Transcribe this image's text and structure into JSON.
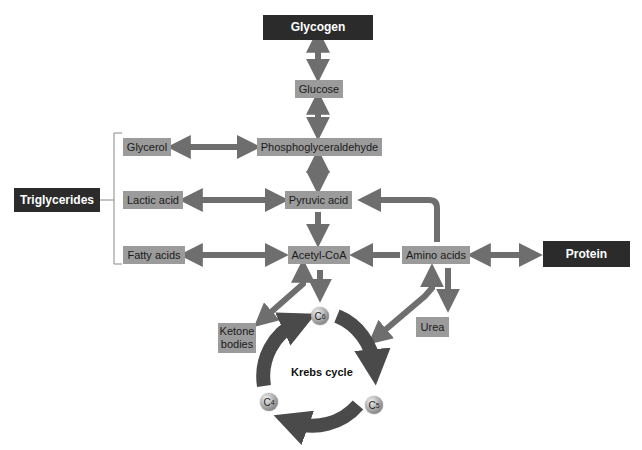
{
  "diagram": {
    "colors": {
      "box": "#9b9b9b",
      "dark_box": "#2b2b2b",
      "arrow": "#6e6e6e",
      "cycle_arrow": "#4a4a4a"
    },
    "nodes": {
      "glycogen": "Glycogen",
      "glucose": "Glucose",
      "phosphoglyceraldehyde": "Phosphoglyceraldehyde",
      "glycerol": "Glycerol",
      "triglycerides": "Triglycerides",
      "lactic_acid": "Lactic acid",
      "pyruvic_acid": "Pyruvic acid",
      "fatty_acids": "Fatty acids",
      "acetyl_coa": "Acetyl-CoA",
      "amino_acids": "Amino acids",
      "protein": "Protein",
      "urea": "Urea",
      "ketone_bodies": "Ketone bodies",
      "krebs_cycle": "Krebs cycle"
    },
    "cycle_intermediates": {
      "c6": {
        "letter": "C",
        "sub": "6"
      },
      "c5": {
        "letter": "C",
        "sub": "5"
      },
      "c4": {
        "letter": "C",
        "sub": "4"
      }
    },
    "edges": [
      {
        "from": "Glycogen",
        "to": "Glucose",
        "type": "bidirectional"
      },
      {
        "from": "Glucose",
        "to": "Phosphoglyceraldehyde",
        "type": "bidirectional"
      },
      {
        "from": "Glycerol",
        "to": "Phosphoglyceraldehyde",
        "type": "bidirectional"
      },
      {
        "from": "Phosphoglyceraldehyde",
        "to": "Pyruvic acid",
        "type": "bidirectional"
      },
      {
        "from": "Lactic acid",
        "to": "Pyruvic acid",
        "type": "bidirectional"
      },
      {
        "from": "Pyruvic acid",
        "to": "Acetyl-CoA",
        "type": "forward"
      },
      {
        "from": "Fatty acids",
        "to": "Acetyl-CoA",
        "type": "bidirectional"
      },
      {
        "from": "Amino acids",
        "to": "Acetyl-CoA",
        "type": "forward"
      },
      {
        "from": "Amino acids",
        "to": "Pyruvic acid",
        "type": "forward"
      },
      {
        "from": "Amino acids",
        "to": "Protein",
        "type": "bidirectional"
      },
      {
        "from": "Amino acids",
        "to": "Urea",
        "type": "forward"
      },
      {
        "from": "Acetyl-CoA",
        "to": "Ketone bodies",
        "type": "bidirectional"
      },
      {
        "from": "Acetyl-CoA",
        "to": "Krebs cycle",
        "type": "forward"
      },
      {
        "from": "Krebs cycle",
        "to": "Amino acids",
        "type": "bidirectional"
      }
    ]
  }
}
